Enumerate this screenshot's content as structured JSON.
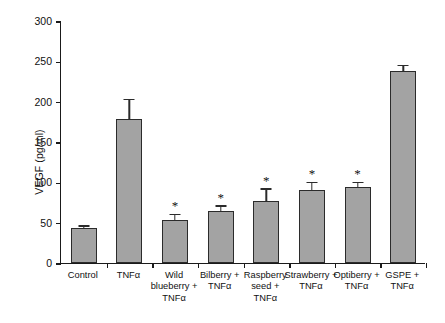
{
  "chart_data": {
    "type": "bar",
    "title": "",
    "subtitle": "",
    "xlabel": "",
    "ylabel": "VEGF (pg/ml)",
    "ylim": [
      0,
      300
    ],
    "yticks": [
      0,
      50,
      100,
      150,
      200,
      250,
      300
    ],
    "grid": false,
    "legend": null,
    "categories": [
      "Control",
      "TNFα",
      "Wild\nblueberry +\nTNFα",
      "Bilberry +\nTNFα",
      "Raspberry\nseed +\nTNFα",
      "Strawberry +\nTNFα",
      "Optiberry +\nTNFα",
      "GSPE +\nTNFα"
    ],
    "values": [
      43,
      178,
      53,
      64,
      77,
      90,
      94,
      238
    ],
    "errors": [
      2,
      24,
      6,
      6,
      14,
      9,
      5,
      6
    ],
    "annotations": [
      "",
      "",
      "*",
      "*",
      "*",
      "*",
      "*",
      ""
    ],
    "bar_color": "#a3a3a3",
    "bar_edge_color": "#2b2b2b",
    "axis_color": "#1a1a1a",
    "annotation_note": "* denotes statistically significant difference"
  }
}
